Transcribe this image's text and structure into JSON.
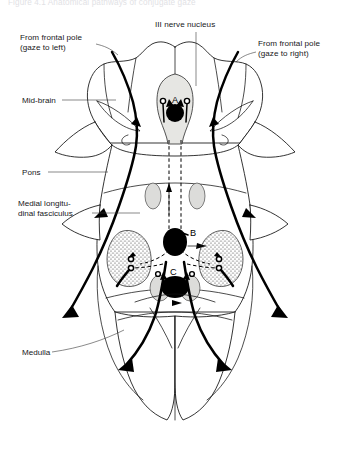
{
  "figure": {
    "caption": "Figure 4.1 Anatomical pathways of conjugate gaze"
  },
  "labels": {
    "top_center": "III nerve nucleus",
    "top_left_line1": "From frontal pole",
    "top_left_line2": "(gaze to left)",
    "top_right_line1": "From frontal pole",
    "top_right_line2": "(gaze to right)",
    "midbrain": "Mid-brain",
    "pons": "Pons",
    "mlf_line1": "Medial longitu-",
    "mlf_line2": "dinal fasciculus",
    "medulla": "Medulla"
  },
  "lesion_points": [
    {
      "id": "A",
      "label": "A",
      "region": "midbrain"
    },
    {
      "id": "B",
      "label": "B",
      "region": "pons"
    },
    {
      "id": "C",
      "label": "C",
      "region": "lower-pons"
    }
  ],
  "colors": {
    "ink": "#111111",
    "tract": "#000000",
    "nucleus_fill": "#dcdcda",
    "tegmentum_fill": "#e6e6e3",
    "background": "#ffffff",
    "leader": "#3a3a3a"
  }
}
